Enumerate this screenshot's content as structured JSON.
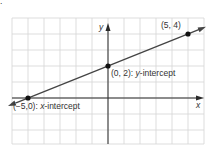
{
  "chart_data": {
    "type": "line",
    "title": "",
    "xlabel": "x",
    "ylabel": "y",
    "xlim": [
      -6,
      6
    ],
    "ylim": [
      -3,
      5
    ],
    "grid": true,
    "line": {
      "slope": 0.4,
      "intercept": 2,
      "equation": "y = 0.4x + 2"
    },
    "points": [
      {
        "x": -5,
        "y": 0,
        "label": "(−5,0): x-intercept",
        "coord": "(−5,0): ",
        "italic_var": "x",
        "suffix": "-intercept"
      },
      {
        "x": 0,
        "y": 2,
        "label": "(0, 2): y-intercept",
        "coord": "(0, 2): ",
        "italic_var": "y",
        "suffix": "-intercept"
      },
      {
        "x": 5,
        "y": 4,
        "label": "(5, 4)",
        "coord": "(5, 4)",
        "italic_var": "",
        "suffix": ""
      }
    ]
  },
  "axes": {
    "x_label": "x",
    "y_label": "y"
  },
  "colors": {
    "grid": "#d4d4d4",
    "axis": "#2a2a2a",
    "line": "#444444",
    "point": "#111111"
  },
  "corner_mark": "."
}
